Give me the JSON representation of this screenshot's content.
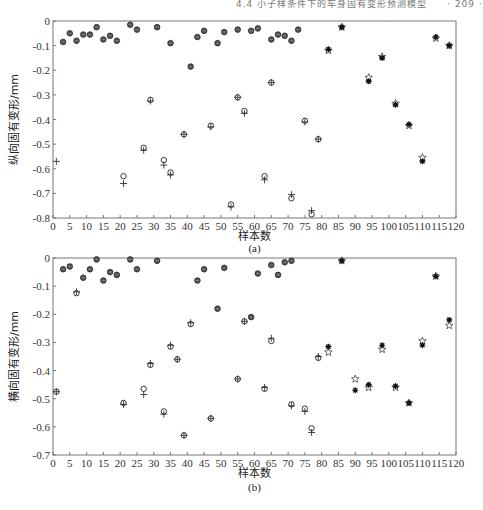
{
  "running_header": "4.4 小子样条件下的车身固有变形预测模型　　· 209 ·",
  "chart_data": [
    {
      "type": "scatter",
      "panel": "(a)",
      "title": "",
      "xlabel": "样本数",
      "ylabel": "纵向固有变形/mm",
      "xlim": [
        0,
        120
      ],
      "ylim": [
        -0.8,
        0
      ],
      "xticks": [
        0,
        5,
        10,
        15,
        20,
        25,
        30,
        35,
        40,
        45,
        50,
        55,
        60,
        65,
        70,
        75,
        80,
        85,
        90,
        95,
        100,
        105,
        110,
        115,
        120
      ],
      "yticks": [
        0,
        -0.1,
        -0.2,
        -0.3,
        -0.4,
        -0.5,
        -0.6,
        -0.7,
        -0.8
      ],
      "ytick_labels": [
        "0",
        "-0.1",
        "-0.2",
        "-0.3",
        "-0.4",
        "-0.5",
        "-0.6",
        "-0.7",
        "-0.8"
      ],
      "grid": false,
      "legend": [],
      "series": [
        {
          "name": "训练样本实测值",
          "marker": "filled-circle",
          "x": [
            3,
            5,
            7,
            9,
            11,
            13,
            15,
            17,
            19,
            23,
            25,
            31,
            35,
            41,
            43,
            45,
            49,
            51,
            55,
            59,
            61,
            65,
            67,
            69,
            71,
            73
          ],
          "y": [
            -0.085,
            -0.05,
            -0.08,
            -0.055,
            -0.055,
            -0.025,
            -0.075,
            -0.06,
            -0.08,
            -0.015,
            -0.035,
            -0.025,
            -0.09,
            -0.185,
            -0.065,
            -0.04,
            -0.09,
            -0.045,
            -0.035,
            -0.04,
            -0.03,
            -0.075,
            -0.055,
            -0.06,
            -0.08,
            -0.035
          ]
        },
        {
          "name": "训练样本预测值",
          "marker": "plus",
          "x": [
            1,
            21,
            27,
            29,
            33,
            35,
            39,
            47,
            53,
            55,
            57,
            63,
            65,
            71,
            75,
            77,
            79
          ],
          "y": [
            -0.57,
            -0.66,
            -0.525,
            -0.325,
            -0.585,
            -0.625,
            -0.46,
            -0.43,
            -0.755,
            -0.31,
            -0.375,
            -0.645,
            -0.25,
            -0.705,
            -0.41,
            -0.77,
            -0.48
          ]
        },
        {
          "name": "测试样本预测值",
          "marker": "circle",
          "x": [
            21,
            27,
            29,
            33,
            35,
            39,
            47,
            53,
            55,
            57,
            63,
            65,
            71,
            75,
            77,
            79
          ],
          "y": [
            -0.63,
            -0.515,
            -0.32,
            -0.565,
            -0.615,
            -0.46,
            -0.425,
            -0.745,
            -0.31,
            -0.365,
            -0.63,
            -0.25,
            -0.72,
            -0.405,
            -0.785,
            -0.48
          ]
        },
        {
          "name": "测试样本实测值",
          "marker": "star",
          "x": [
            82,
            86,
            94,
            98,
            102,
            106,
            110,
            114,
            118
          ],
          "y": [
            -0.12,
            -0.025,
            -0.23,
            -0.145,
            -0.335,
            -0.425,
            -0.555,
            -0.07,
            -0.1
          ]
        },
        {
          "name": "测试样本模型输出",
          "marker": "asterisk",
          "x": [
            82,
            86,
            94,
            98,
            102,
            106,
            110,
            114,
            118
          ],
          "y": [
            -0.115,
            -0.025,
            -0.245,
            -0.15,
            -0.34,
            -0.42,
            -0.57,
            -0.065,
            -0.1
          ]
        }
      ]
    },
    {
      "type": "scatter",
      "panel": "(b)",
      "title": "",
      "xlabel": "样本数",
      "ylabel": "横向固有变形/mm",
      "xlim": [
        0,
        120
      ],
      "ylim": [
        -0.7,
        0
      ],
      "xticks": [
        0,
        5,
        10,
        15,
        20,
        25,
        30,
        35,
        40,
        45,
        50,
        55,
        60,
        65,
        70,
        75,
        80,
        85,
        90,
        95,
        100,
        105,
        110,
        115,
        120
      ],
      "yticks": [
        0,
        -0.1,
        -0.2,
        -0.3,
        -0.4,
        -0.5,
        -0.6,
        -0.7
      ],
      "ytick_labels": [
        "0",
        "-0.1",
        "-0.2",
        "-0.3",
        "-0.4",
        "-0.5",
        "-0.6",
        "-0.7"
      ],
      "grid": false,
      "legend": [],
      "series": [
        {
          "name": "训练样本实测值",
          "marker": "filled-circle",
          "x": [
            3,
            5,
            9,
            11,
            13,
            15,
            17,
            19,
            23,
            25,
            31,
            43,
            45,
            49,
            51,
            59,
            61,
            65,
            67,
            69,
            71
          ],
          "y": [
            -0.04,
            -0.03,
            -0.07,
            -0.04,
            -0.005,
            -0.08,
            -0.05,
            -0.06,
            -0.005,
            -0.04,
            -0.01,
            -0.08,
            -0.04,
            -0.18,
            -0.035,
            -0.21,
            -0.055,
            -0.025,
            -0.06,
            -0.015,
            -0.01
          ]
        },
        {
          "name": "训练样本预测值",
          "marker": "plus",
          "x": [
            1,
            7,
            21,
            27,
            29,
            33,
            35,
            37,
            39,
            41,
            47,
            55,
            57,
            63,
            65,
            71,
            75,
            77,
            79
          ],
          "y": [
            -0.475,
            -0.12,
            -0.52,
            -0.485,
            -0.375,
            -0.555,
            -0.31,
            -0.36,
            -0.63,
            -0.23,
            -0.57,
            -0.43,
            -0.225,
            -0.46,
            -0.285,
            -0.525,
            -0.545,
            -0.62,
            -0.35
          ]
        },
        {
          "name": "测试样本预测值",
          "marker": "circle",
          "x": [
            1,
            7,
            21,
            27,
            29,
            33,
            35,
            37,
            39,
            41,
            47,
            55,
            57,
            63,
            65,
            71,
            75,
            77,
            79
          ],
          "y": [
            -0.475,
            -0.125,
            -0.515,
            -0.465,
            -0.38,
            -0.545,
            -0.315,
            -0.36,
            -0.63,
            -0.235,
            -0.57,
            -0.43,
            -0.225,
            -0.465,
            -0.295,
            -0.52,
            -0.535,
            -0.605,
            -0.355
          ]
        },
        {
          "name": "测试样本实测值",
          "marker": "star",
          "x": [
            82,
            86,
            90,
            94,
            98,
            102,
            106,
            110,
            114,
            118
          ],
          "y": [
            -0.335,
            -0.01,
            -0.43,
            -0.46,
            -0.325,
            -0.46,
            -0.515,
            -0.295,
            -0.065,
            -0.24
          ]
        },
        {
          "name": "测试样本模型输出",
          "marker": "asterisk",
          "x": [
            82,
            86,
            90,
            94,
            98,
            102,
            106,
            110,
            114,
            118
          ],
          "y": [
            -0.315,
            -0.01,
            -0.47,
            -0.45,
            -0.31,
            -0.455,
            -0.515,
            -0.31,
            -0.065,
            -0.22
          ]
        }
      ]
    }
  ]
}
